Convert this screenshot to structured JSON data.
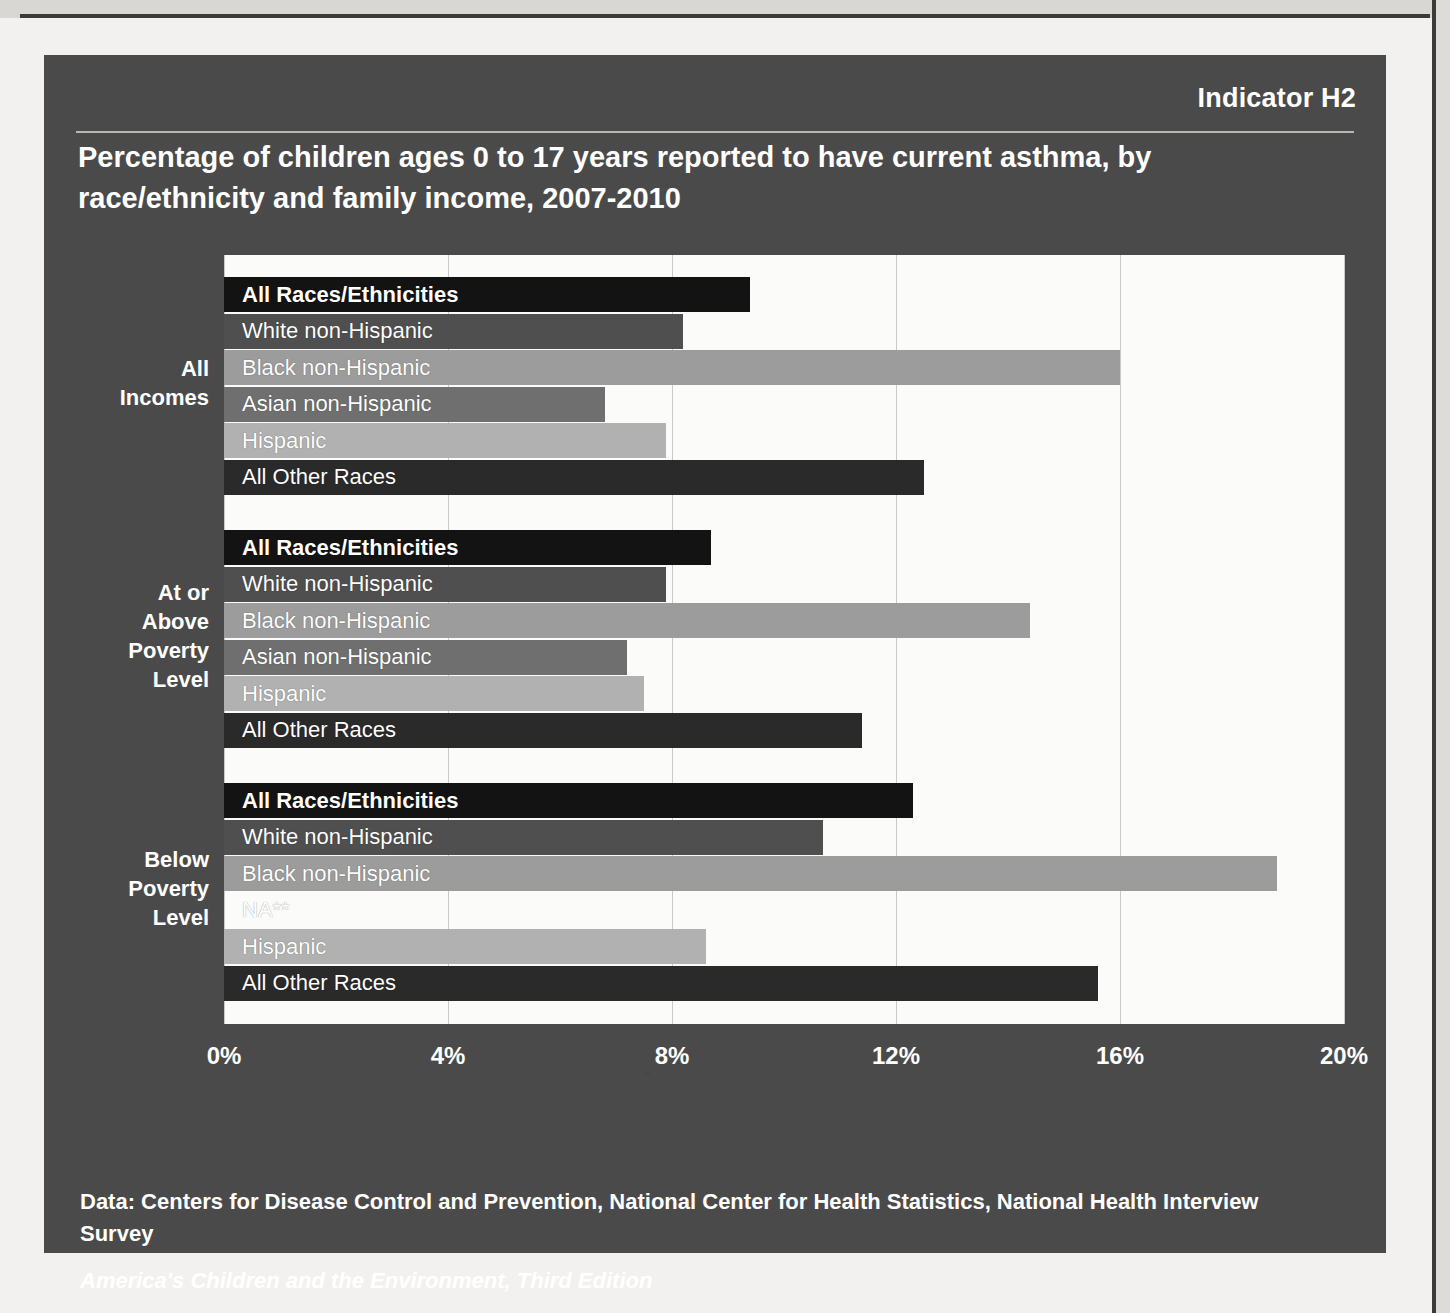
{
  "panel": {
    "indicator": "Indicator H2",
    "title": "Percentage of children ages 0 to 17 years reported to have current asthma, by race/ethnicity and family income, 2007-2010",
    "source_line": "Data: Centers for Disease Control and Prevention, National Center for Health Statistics, National Health Interview Survey",
    "series_line": "America's Children and the Environment, Third Edition",
    "colors": {
      "panel_bg": "#4a4a4a",
      "plot_bg": "#fbfbfa",
      "gridline": "#c9c9c6",
      "bar_all_races": "#131313",
      "bar_white": "#4f4f4f",
      "bar_black": "#9c9c9c",
      "bar_asian": "#6f6f6f",
      "bar_hispanic": "#b1b1b1",
      "bar_other": "#2a2a2a",
      "text": "#ffffff"
    }
  },
  "chart_data": {
    "type": "bar",
    "orientation": "horizontal",
    "title": "Percentage of children ages 0 to 17 years reported to have current asthma, by race/ethnicity and family income, 2007-2010",
    "xlabel": "",
    "ylabel": "",
    "xlim": [
      0,
      20
    ],
    "xticks": [
      "0%",
      "4%",
      "8%",
      "12%",
      "16%",
      "20%"
    ],
    "xtick_values": [
      0,
      4,
      8,
      12,
      16,
      20
    ],
    "grid": true,
    "legend": "none",
    "groups": [
      {
        "label": "All Incomes",
        "label_lines": [
          "All",
          "Incomes"
        ],
        "bars": [
          {
            "category": "All Races/Ethnicities",
            "value": 9.4,
            "bold": true,
            "color_key": "bar_all_races"
          },
          {
            "category": "White non-Hispanic",
            "value": 8.2,
            "bold": false,
            "color_key": "bar_white"
          },
          {
            "category": "Black non-Hispanic",
            "value": 16.0,
            "bold": false,
            "color_key": "bar_black"
          },
          {
            "category": "Asian non-Hispanic",
            "value": 6.8,
            "bold": false,
            "color_key": "bar_asian"
          },
          {
            "category": "Hispanic",
            "value": 7.9,
            "bold": false,
            "color_key": "bar_hispanic"
          },
          {
            "category": "All Other Races",
            "value": 12.5,
            "bold": false,
            "color_key": "bar_other"
          }
        ]
      },
      {
        "label": "At or Above Poverty Level",
        "label_lines": [
          "At or",
          "Above",
          "Poverty",
          "Level"
        ],
        "bars": [
          {
            "category": "All Races/Ethnicities",
            "value": 8.7,
            "bold": true,
            "color_key": "bar_all_races"
          },
          {
            "category": "White non-Hispanic",
            "value": 7.9,
            "bold": false,
            "color_key": "bar_white"
          },
          {
            "category": "Black non-Hispanic",
            "value": 14.4,
            "bold": false,
            "color_key": "bar_black"
          },
          {
            "category": "Asian non-Hispanic",
            "value": 7.2,
            "bold": false,
            "color_key": "bar_asian"
          },
          {
            "category": "Hispanic",
            "value": 7.5,
            "bold": false,
            "color_key": "bar_hispanic"
          },
          {
            "category": "All Other Races",
            "value": 11.4,
            "bold": false,
            "color_key": "bar_other"
          }
        ]
      },
      {
        "label": "Below Poverty Level",
        "label_lines": [
          "Below",
          "Poverty",
          "Level"
        ],
        "bars": [
          {
            "category": "All Races/Ethnicities",
            "value": 12.3,
            "bold": true,
            "color_key": "bar_all_races"
          },
          {
            "category": "White non-Hispanic",
            "value": 10.7,
            "bold": false,
            "color_key": "bar_white"
          },
          {
            "category": "Black non-Hispanic",
            "value": 18.8,
            "bold": false,
            "color_key": "bar_black"
          },
          {
            "category": "NA**",
            "value": 0.0,
            "bold": false,
            "color_key": "bar_asian"
          },
          {
            "category": "Hispanic",
            "value": 8.6,
            "bold": false,
            "color_key": "bar_hispanic"
          },
          {
            "category": "All Other Races",
            "value": 15.6,
            "bold": false,
            "color_key": "bar_other"
          }
        ]
      }
    ]
  }
}
